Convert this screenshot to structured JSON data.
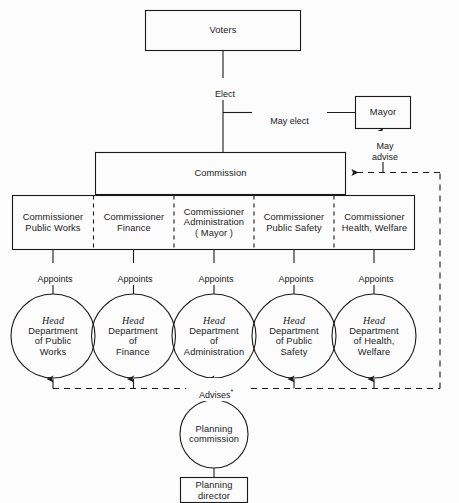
{
  "diagram": {
    "colors": {
      "stroke": "#1a1a1a",
      "background": "#fcfcfc",
      "text": "#1a1a1a"
    }
  },
  "nodes": {
    "voters": {
      "label": "Voters",
      "shape": "rect"
    },
    "mayor": {
      "label": "Mayor",
      "shape": "rect"
    },
    "commission": {
      "label": "Commission",
      "shape": "rect"
    },
    "planning_commission": {
      "label": "Planning\ncommission",
      "shape": "circle"
    },
    "planning_director": {
      "label": "Planning\ndirector",
      "shape": "rect"
    }
  },
  "commissioners": [
    {
      "label": "Commissioner\nPublic Works"
    },
    {
      "label": "Commissioner\nFinance"
    },
    {
      "label": "Commissioner\nAdministration\n( Mayor )"
    },
    {
      "label": "Commissioner\nPublic Safety"
    },
    {
      "label": "Commissioner\nHealth, Welfare"
    }
  ],
  "departments": [
    {
      "head": "Head",
      "label": "Department\nof Public\nWorks"
    },
    {
      "head": "Head",
      "label": "Department\nof\nFinance"
    },
    {
      "head": "Head",
      "label": "Department\nof\nAdministration"
    },
    {
      "head": "Head",
      "label": "Department\nof Public\nSafety"
    },
    {
      "head": "Head",
      "label": "Department\nof Health,\nWelfare"
    }
  ],
  "edge_labels": {
    "elect": "Elect",
    "may_elect": "May elect",
    "may_advise": "May\nadvise",
    "appoints": [
      "Appoints",
      "Appoints",
      "Appoints",
      "Appoints",
      "Appoints"
    ],
    "advises": "Advises",
    "advises_marker": "*"
  }
}
